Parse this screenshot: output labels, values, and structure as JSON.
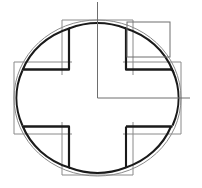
{
  "drawing": {
    "title": "Cross-in-circle technical outline",
    "background_color": "#ffffff",
    "width": 202,
    "height": 188,
    "center": {
      "x": 97.5,
      "y": 98
    },
    "stroke_colors": {
      "thick_outline": "#1a1a1a",
      "thin_outline": "#8a8a8a",
      "centerline": "#6e6e6e",
      "aux_rectangle": "#6e6e6e"
    },
    "stroke_widths": {
      "thick_outline": 2.1,
      "thin_outline": 1.0,
      "centerline": 1.0,
      "aux_rectangle": 1.0
    },
    "inner_circle": {
      "label": "main body circle",
      "center_x": 97.5,
      "center_y": 98,
      "radius_x": 75.5,
      "radius_y": 71
    },
    "outer_circle": {
      "label": "offset outline circle",
      "center_x": 97.5,
      "center_y": 98,
      "radius_x": 83.5,
      "radius_y": 78
    },
    "cross": {
      "label": "plus / cross profile",
      "arm_half_width": 29,
      "arm_outer_half_width": 36,
      "notch_depth": 14,
      "top_y": 20,
      "bottom_y": 175,
      "left_x": 14,
      "right_x": 181
    },
    "centerlines": {
      "vertical": {
        "label": "vertical centerline",
        "x": 97.5,
        "y_start": 2,
        "y_end": 98
      },
      "horizontal": {
        "label": "horizontal centerline",
        "y": 98,
        "x_start": 97.5,
        "x_end": 190
      }
    },
    "aux_rectangle": {
      "label": "upper-right auxiliary rectangle",
      "x": 127,
      "y": 22,
      "width": 43,
      "height": 35
    }
  }
}
